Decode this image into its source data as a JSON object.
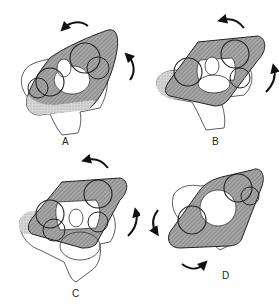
{
  "figure": {
    "panels": [
      {
        "id": "A",
        "label": "A",
        "rotation": "counterclockwise-top, clockwise-right"
      },
      {
        "id": "B",
        "label": "B",
        "rotation": "counterclockwise-top, clockwise-right"
      },
      {
        "id": "C",
        "label": "C",
        "rotation": "counterclockwise-top, clockwise-right"
      },
      {
        "id": "D",
        "label": "D",
        "rotation": "counterclockwise-left, clockwise-bottom"
      }
    ],
    "colors": {
      "outline": "#222222",
      "shade_dark": "#8a8a8a",
      "shade_light": "#c8c8c8",
      "background": "#ffffff"
    }
  }
}
